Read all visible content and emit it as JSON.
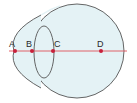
{
  "diagram": {
    "points": [
      {
        "label": "A",
        "x": 15,
        "y": 51
      },
      {
        "label": "B",
        "x": 32,
        "y": 51
      },
      {
        "label": "C",
        "x": 53,
        "y": 51
      },
      {
        "label": "D",
        "x": 101,
        "y": 51
      }
    ],
    "colors": {
      "eyeball_fill": "#e4f2f5",
      "outline": "#555555",
      "axis": "#e0505a",
      "point": "#c8203a"
    }
  }
}
